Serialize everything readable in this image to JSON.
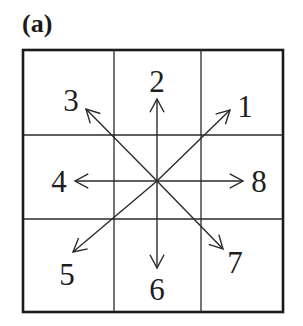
{
  "panel_label": "(a)",
  "grid": {
    "rows": 3,
    "cols": 3,
    "outer_box": {
      "x1": 23,
      "y1": 50,
      "x2": 283,
      "y2": 312
    },
    "vertical_lines_x": [
      114,
      201
    ],
    "horizontal_lines_y": [
      135,
      219
    ],
    "line_color": "#2a2a2a"
  },
  "center": {
    "x": 157,
    "y": 181
  },
  "directions": [
    {
      "id": "1",
      "label": "1",
      "angle_deg": 45,
      "tip": {
        "x": 230,
        "y": 110
      },
      "label_pos": {
        "x": 245,
        "y": 117
      }
    },
    {
      "id": "2",
      "label": "2",
      "angle_deg": 90,
      "tip": {
        "x": 157,
        "y": 99
      },
      "label_pos": {
        "x": 157,
        "y": 92
      }
    },
    {
      "id": "3",
      "label": "3",
      "angle_deg": 135,
      "tip": {
        "x": 86,
        "y": 109
      },
      "label_pos": {
        "x": 71,
        "y": 111
      }
    },
    {
      "id": "4",
      "label": "4",
      "angle_deg": 180,
      "tip": {
        "x": 75,
        "y": 181
      },
      "label_pos": {
        "x": 59,
        "y": 192
      }
    },
    {
      "id": "5",
      "label": "5",
      "angle_deg": 225,
      "tip": {
        "x": 73,
        "y": 252
      },
      "label_pos": {
        "x": 67,
        "y": 285
      }
    },
    {
      "id": "6",
      "label": "6",
      "angle_deg": 270,
      "tip": {
        "x": 157,
        "y": 268
      },
      "label_pos": {
        "x": 157,
        "y": 300
      }
    },
    {
      "id": "7",
      "label": "7",
      "angle_deg": 315,
      "tip": {
        "x": 223,
        "y": 249
      },
      "label_pos": {
        "x": 235,
        "y": 273
      }
    },
    {
      "id": "8",
      "label": "8",
      "angle_deg": 0,
      "tip": {
        "x": 243,
        "y": 181
      },
      "label_pos": {
        "x": 259,
        "y": 192
      }
    }
  ]
}
